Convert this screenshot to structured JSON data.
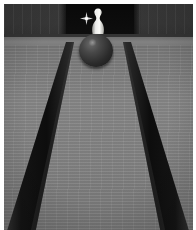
{
  "scene": {
    "title": "Bowling lane with pin and ball",
    "width": 196,
    "height": 230,
    "alt_text": "A bowling ball rolling down a gray wooden lane toward a single white pin standing in a dark pin deck, with dark gutters on both sides."
  },
  "regions": {
    "back_wall": {
      "label": "Back wall masking unit",
      "color": "#3a3a3a"
    },
    "pin_deck": {
      "label": "Pin deck recess",
      "color": "#0d0d0d"
    },
    "foul_band": {
      "label": "Light horizontal band",
      "color": "#828282"
    },
    "lane": {
      "label": "Lane bed",
      "color": "#858585"
    },
    "gutter_left": {
      "label": "Left gutter",
      "color": "#1a1a1a"
    },
    "gutter_right": {
      "label": "Right gutter",
      "color": "#1a1a1a"
    }
  },
  "objects": {
    "ball": {
      "label": "Bowling ball",
      "color": "#2b2b2b",
      "icon": "bowling-ball-icon"
    },
    "pin": {
      "label": "Bowling pin",
      "color": "#f2f2ee",
      "icon": "bowling-pin-icon"
    },
    "sparkle": {
      "label": "Sparkle highlight",
      "color": "#e8e8e8",
      "icon": "sparkle-icon"
    }
  },
  "frame": {
    "label": "Photo border",
    "color": "#ffffff"
  }
}
